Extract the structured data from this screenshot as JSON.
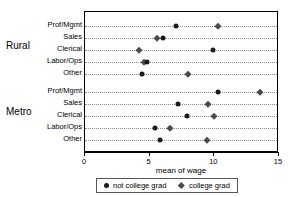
{
  "chart_data": {
    "type": "scatter",
    "title": "",
    "xlabel": "mean of wage",
    "ylabel": "",
    "xlim": [
      0,
      15
    ],
    "xticks": [
      0,
      5,
      10,
      15
    ],
    "xtick_labels": [
      "0",
      "5",
      "10",
      "15"
    ],
    "grid": "dotted-horizontal-per-category",
    "legend_position": "bottom",
    "groups": [
      {
        "label": "Rural",
        "categories": [
          "Prof/Mgmt",
          "Sales",
          "Clerical",
          "Labor/Ops",
          "Other"
        ],
        "not_college_grad": [
          7.0,
          6.0,
          9.9,
          4.8,
          4.4
        ],
        "college_grad": [
          10.3,
          5.6,
          4.2,
          4.6,
          8.0
        ]
      },
      {
        "label": "Metro",
        "categories": [
          "Prof/Mgmt",
          "Sales",
          "Clerical",
          "Labor/Ops",
          "Other"
        ],
        "not_college_grad": [
          10.3,
          7.2,
          7.9,
          5.4,
          5.8
        ],
        "college_grad": [
          13.5,
          9.5,
          10.0,
          6.6,
          9.4
        ]
      }
    ],
    "series": [
      {
        "name": "not college grad",
        "marker": "circle",
        "color": "#1a1a1a"
      },
      {
        "name": "college grad",
        "marker": "diamond",
        "color": "#4a4a4a"
      }
    ]
  },
  "legend": {
    "entries": [
      {
        "label": "not college grad",
        "marker": "circle-marker-icon"
      },
      {
        "label": "college grad",
        "marker": "diamond-marker-icon"
      }
    ]
  },
  "axis": {
    "x_title": "mean of wage"
  }
}
